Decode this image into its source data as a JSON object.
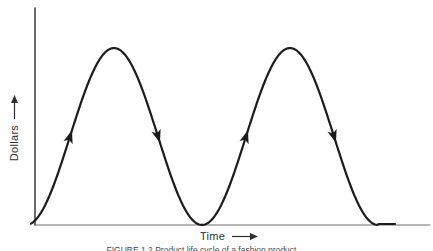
{
  "axes": {
    "y_label": "Dollars",
    "x_label": "Time"
  },
  "caption": {
    "text": "FIGURE 1.2   Product life cycle of a fashion product"
  },
  "colors": {
    "background": "#ffffff",
    "curve": "#1c1c1c",
    "y_axis": "#2e2e2e",
    "x_axis": "#6f6f6f",
    "label_text": "#2f2f2f",
    "caption_text": "#4a4a4a"
  },
  "chart_data": {
    "type": "line",
    "title": "",
    "xlabel": "Time",
    "ylabel": "Dollars",
    "x_ticks": [],
    "y_ticks": [],
    "grid": false,
    "legend": null,
    "axis_ranges": {
      "x": "unlabeled, arbitrary time units",
      "y": "unlabeled, arbitrary dollar units"
    },
    "series": [
      {
        "name": "recurring-product-life-cycle",
        "shape": "two identical bell-shaped cycles (raised-cosine humps) rising from zero to a peak and returning to zero, then flat at zero after the second cycle",
        "peaks_normalized": [
          {
            "x": 0.22,
            "y": 1.0
          },
          {
            "x": 0.66,
            "y": 1.0
          }
        ],
        "zeros_normalized": [
          0.0,
          0.44,
          0.88,
          1.0
        ],
        "flow_arrows": [
          {
            "flank": "first-rise",
            "direction": "up"
          },
          {
            "flank": "first-fall",
            "direction": "down"
          },
          {
            "flank": "second-rise",
            "direction": "up"
          },
          {
            "flank": "second-fall",
            "direction": "down"
          }
        ]
      }
    ],
    "geometry": {
      "cycle_start_x": 26,
      "period": 176,
      "baseline_y": 225,
      "amplitude": 177,
      "curve_start_x": 31,
      "curve_end_x": 396,
      "clamp_end_x": 378,
      "y_axis": {
        "x": 35,
        "y_top": 8,
        "y_bottom": 225
      },
      "x_axis": {
        "y": 225,
        "x_left": 35,
        "x_right": 430
      },
      "arrows": [
        {
          "cycle": 0,
          "u": 0.25,
          "dir": "up"
        },
        {
          "cycle": 0,
          "u": 0.75,
          "dir": "down"
        },
        {
          "cycle": 1,
          "u": 0.25,
          "dir": "up"
        },
        {
          "cycle": 1,
          "u": 0.75,
          "dir": "down"
        }
      ]
    }
  }
}
